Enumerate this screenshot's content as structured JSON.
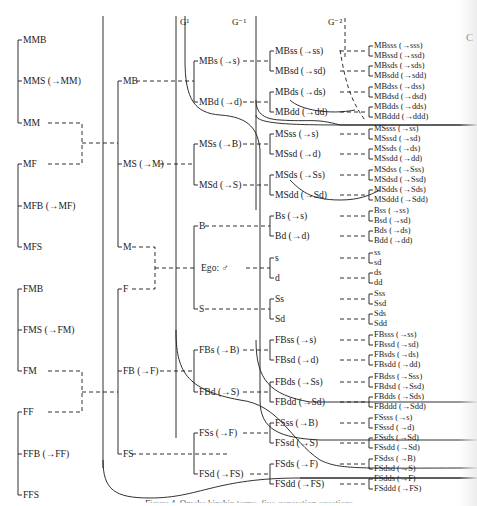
{
  "generations": {
    "g1": "G¹",
    "gm1": "G⁻¹",
    "gm2": "G⁻²"
  },
  "col1": [
    "MMB",
    "MMS (→MM)",
    "MM",
    "MF",
    "MFB (→MF)",
    "MFS",
    "FMB",
    "FMS (→FM)",
    "FM",
    "FF",
    "FFB (→FF)",
    "FFS"
  ],
  "col2": [
    "MB",
    "MS (→M)",
    "M",
    "F",
    "FB (→F)",
    "FS"
  ],
  "col3": [
    "MBs (→s)",
    "MBd (→d)",
    "MSs (→B)",
    "MSd (→S)",
    "B",
    "Ego: ♂",
    "S",
    "FBs (→B)",
    "FBd (→S)",
    "FSs (→F)",
    "FSd (→FS)"
  ],
  "col4": [
    "MBss (→ss)",
    "MBsd (→sd)",
    "MBds (→ds)",
    "MBdd (→dd)",
    "MSss (→s)",
    "MSsd (→d)",
    "MSds (→Ss)",
    "MSdd (→Sd)",
    "Bs (→s)",
    "Bd (→d)",
    "s",
    "d",
    "Ss",
    "Sd",
    "FBss (→s)",
    "FBsd (→d)",
    "FBds (→Ss)",
    "FBdd (→Sd)",
    "FSss (→B)",
    "FSsd (→S)",
    "FSds (→F)",
    "FSdd (→FS)"
  ],
  "col5": [
    "MBsss (→sss)",
    "MBssd (→ssd)",
    "MBsds (→sds)",
    "MBsdd (→sdd)",
    "MBdss (→dss)",
    "MBdsd (→dsd)",
    "MBdds (→dds)",
    "MBddd (→ddd)",
    "MSsss (→ss)",
    "MSssd (→sd)",
    "MSsds (→ds)",
    "MSsdd (→dd)",
    "MSdss (→Sss)",
    "MSdsd (→Ssd)",
    "MSdds (→Sds)",
    "MSddd (→Sdd)",
    "Bss (→ss)",
    "Bsd (→sd)",
    "Bds (→ds)",
    "Bdd (→dd)",
    "ss",
    "sd",
    "ds",
    "dd",
    "Sss",
    "Ssd",
    "Sds",
    "Sdd",
    "FBsss (→ss)",
    "FBssd (→sd)",
    "FBsds (→ds)",
    "FBsdd (→dd)",
    "FBdss (→Sss)",
    "FBdsd (→Ssd)",
    "FBdds (→Sds)",
    "FBddd (→Sdd)",
    "FSsss (→s)",
    "FSssd (→d)",
    "FSsds (→Sd)",
    "FSsdd (→Sd)",
    "FSdss (→B)",
    "FSdsd (→S)",
    "FSdds (→F)",
    "FSddd (→FS)"
  ],
  "caption": "Figure 4. Omaha kinship terms, five-generation equations",
  "corner_glyph": "C",
  "colors": {
    "ink": "#1a1a1a",
    "paper": "#ffffff"
  }
}
